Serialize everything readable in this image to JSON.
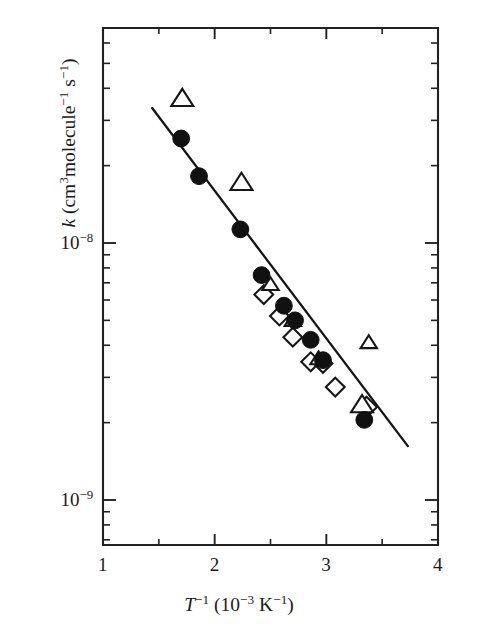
{
  "figure": {
    "background_color": "#ffffff",
    "ink_color": "#161616"
  },
  "chart_data": {
    "type": "scatter",
    "title": "",
    "subtitle": "",
    "xlabel_plain": "T-1 (10-3 K-1)",
    "xlabel_parts": {
      "symbol": "T",
      "symbol_exponent": "-1",
      "unit_open": " (10",
      "unit_exponent": "−3",
      "unit_close": " K",
      "unit_close_exponent": "−1",
      "unit_tail": ")"
    },
    "ylabel_plain": "k (cm3molecule-1 s-1)",
    "ylabel_parts": {
      "symbol": "k",
      "open": " (cm",
      "cm_exponent": "3",
      "molecule": "molecule",
      "molecule_exponent": "−1",
      "seconds": " s",
      "seconds_exponent": "−1",
      "close": ")"
    },
    "xscale": "linear",
    "yscale": "log",
    "xlim": [
      1,
      4
    ],
    "ylim": [
      6.3e-10,
      4.7e-08
    ],
    "grid": false,
    "legend": "none",
    "xticks": [
      1,
      2,
      3,
      4
    ],
    "xticklabels": [
      "1",
      "2",
      "3",
      "4"
    ],
    "xminorticks": [
      1.5,
      2.5,
      3.5
    ],
    "yticks": [
      1e-08,
      1e-09
    ],
    "yticklabels": [
      "10−8",
      "10−9"
    ],
    "yticklabel_bases": [
      "10",
      "10"
    ],
    "yticklabel_exponents": [
      "−8",
      "−9"
    ],
    "series": [
      {
        "name": "filled-circles",
        "marker": "filled circle",
        "marker_fill": "#111111",
        "points": [
          {
            "x": 1.7,
            "y": 2.55e-08
          },
          {
            "x": 1.86,
            "y": 1.82e-08
          },
          {
            "x": 2.23,
            "y": 1.13e-08
          },
          {
            "x": 2.42,
            "y": 7.5e-09
          },
          {
            "x": 2.62,
            "y": 5.7e-09
          },
          {
            "x": 2.72,
            "y": 5e-09
          },
          {
            "x": 2.86,
            "y": 4.2e-09
          },
          {
            "x": 2.97,
            "y": 3.5e-09
          },
          {
            "x": 3.34,
            "y": 2.05e-09
          }
        ]
      },
      {
        "name": "open-triangles",
        "marker": "open triangle",
        "marker_fill": "#ffffff",
        "points": [
          {
            "x": 1.71,
            "y": 3.65e-08
          },
          {
            "x": 2.24,
            "y": 1.72e-08
          },
          {
            "x": 2.5,
            "y": 6.9e-09
          },
          {
            "x": 2.7,
            "y": 5e-09
          },
          {
            "x": 2.93,
            "y": 3.55e-09
          },
          {
            "x": 3.32,
            "y": 2.35e-09
          },
          {
            "x": 3.38,
            "y": 4.1e-09
          }
        ]
      },
      {
        "name": "open-diamonds",
        "marker": "open diamond",
        "marker_fill": "#ffffff",
        "points": [
          {
            "x": 2.44,
            "y": 6.3e-09
          },
          {
            "x": 2.58,
            "y": 5.2e-09
          },
          {
            "x": 2.7,
            "y": 4.3e-09
          },
          {
            "x": 2.86,
            "y": 3.45e-09
          },
          {
            "x": 2.97,
            "y": 3.4e-09
          },
          {
            "x": 3.08,
            "y": 2.75e-09
          },
          {
            "x": 3.36,
            "y": 2.3e-09
          }
        ]
      }
    ],
    "fit_line": {
      "name": "least-squares fit",
      "x_start": 1.44,
      "y_start": 3.35e-08,
      "x_end": 3.73,
      "y_end": 1.62e-09
    }
  }
}
